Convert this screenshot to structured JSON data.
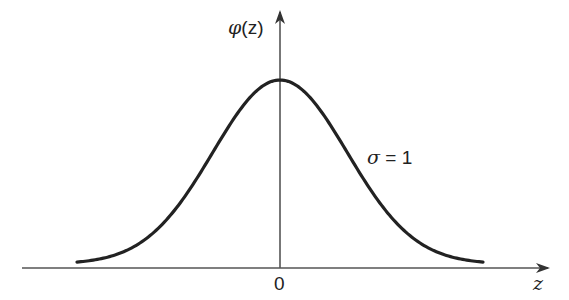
{
  "chart_data": {
    "type": "line",
    "title": "",
    "xlabel": "z",
    "ylabel": "φ(z)",
    "series": [
      {
        "name": "standard normal density",
        "mean": 0,
        "sigma": 1,
        "x": [
          -3.5,
          -3.0,
          -2.5,
          -2.0,
          -1.5,
          -1.0,
          -0.5,
          0.0,
          0.5,
          1.0,
          1.5,
          2.0,
          2.5,
          3.0,
          3.5
        ],
        "values": [
          0.0009,
          0.0044,
          0.0175,
          0.054,
          0.1295,
          0.242,
          0.3521,
          0.3989,
          0.3521,
          0.242,
          0.1295,
          0.054,
          0.0175,
          0.0044,
          0.0009
        ]
      }
    ],
    "x_tick_labels": [
      "0"
    ],
    "annotations": [
      "σ = 1"
    ],
    "grid": false,
    "legend": "none",
    "xlim": [
      -3.5,
      3.5
    ]
  },
  "labels": {
    "y_axis_phi": "φ",
    "y_axis_arg": "(z)",
    "x_axis": "z",
    "origin": "0",
    "sigma_symbol": "σ",
    "sigma_value": " = 1"
  }
}
